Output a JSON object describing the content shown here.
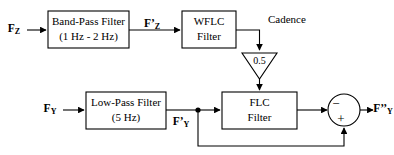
{
  "diagram": {
    "type": "block-diagram",
    "background_color": "#ffffff",
    "line_color": "#000000",
    "blocks": [
      {
        "id": "band_pass",
        "line1": "Band-Pass Filter",
        "line2": "(1 Hz - 2 Hz)",
        "shape": "rectangle"
      },
      {
        "id": "wflc",
        "line1": "WFLC",
        "line2": "Filter",
        "shape": "rectangle"
      },
      {
        "id": "gain",
        "label": "0.5",
        "shape": "triangle-down"
      },
      {
        "id": "low_pass",
        "line1": "Low-Pass Filter",
        "line2": "(5 Hz)",
        "shape": "rectangle"
      },
      {
        "id": "flc",
        "line1": "FLC",
        "line2": "Filter",
        "shape": "rectangle"
      },
      {
        "id": "summing_junction",
        "shape": "circle",
        "minus_sign": "−",
        "plus_sign": "+"
      }
    ],
    "signals": {
      "input_z": {
        "base": "F",
        "prime": "",
        "sub": "Z"
      },
      "filtered_z": {
        "base": "F",
        "prime": "’",
        "sub": "Z"
      },
      "cadence": "Cadence",
      "input_y": {
        "base": "F",
        "prime": "",
        "sub": "Y"
      },
      "filtered_y": {
        "base": "F",
        "prime": "’",
        "sub": "Y"
      },
      "output_y": {
        "base": "F",
        "prime": "’’",
        "sub": "Y"
      }
    }
  }
}
